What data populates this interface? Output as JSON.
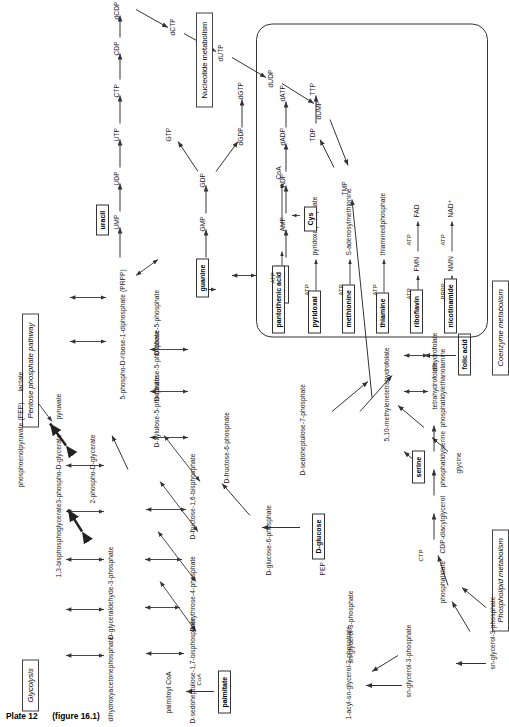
{
  "plate": {
    "caption": "Plate 12",
    "figure_ref": "(figure 16.1)"
  },
  "sections": [
    {
      "id": "glycolysis",
      "label": "Glycolysis",
      "italic": true
    },
    {
      "id": "ppp",
      "label": "Pentose phosphate pathway",
      "italic": true
    },
    {
      "id": "nucleotide",
      "label": "Nucleotide metabolism",
      "italic": false
    },
    {
      "id": "coenzyme",
      "label": "Coenzyme metabolism",
      "italic": true
    },
    {
      "id": "phospholipid",
      "label": "Phospholipid metabolism",
      "italic": true
    }
  ],
  "boxed_nodes": [
    {
      "id": "uracil",
      "label": "uracil"
    },
    {
      "id": "guanine",
      "label": "guanine"
    },
    {
      "id": "adenine",
      "label": "adenine"
    },
    {
      "id": "d-glucose",
      "label": "D-glucose"
    },
    {
      "id": "serine",
      "label": "serine"
    },
    {
      "id": "folic-acid",
      "label": "folic acid"
    },
    {
      "id": "palmitate",
      "label": "palmitate"
    },
    {
      "id": "nicotinamide",
      "label": "nicotinamide"
    },
    {
      "id": "riboflavin",
      "label": "riboflavin"
    },
    {
      "id": "thiamine",
      "label": "thiamine"
    },
    {
      "id": "methionine",
      "label": "methionine"
    },
    {
      "id": "pyridoxal",
      "label": "pyridoxal"
    },
    {
      "id": "pantothenic-acid",
      "label": "pantothenic acid"
    },
    {
      "id": "cys",
      "label": "Cys"
    }
  ],
  "glycolysis": {
    "nodes": [
      "dihydroxyacetonephosphate",
      "D-glyceraldehyde-3-phosphate",
      "1,3-bisphosphoglycerate",
      "3-phospho-D-glycerate",
      "2-phospho-D-glycerate",
      "phosphoenolpyruvate (PEP)",
      "pyruvate",
      "lactate",
      "D-fructose-1,6-bisphosphate",
      "D-fructose-6-phosphate",
      "D-glucose-6-phosphate",
      "D-erythrose-4-phosphate",
      "D-sedoheptulose-1,7-bisphosphate",
      "D-sedoheptulose-7-phosphate",
      "sn-glycerol-3-phosphate"
    ]
  },
  "pentose_phosphate": {
    "nodes": [
      "D-xylulose-5-phosphate",
      "D-ribulose-5-phosphate",
      "D-ribose-5-phosphate",
      "5-phospho-D-ribose-1-diphosphate (PRPP)"
    ]
  },
  "nucleotides": {
    "pyrimidine_chain": [
      "UMP",
      "UDP",
      "UTP",
      "CTP",
      "CDP",
      "dCDP",
      "dCTP",
      "dUTP",
      "dUDP",
      "dUMP"
    ],
    "guanine_chain": [
      "GMP",
      "GDP",
      "GTP",
      "dGDP",
      "dGTP"
    ],
    "adenine_chain": [
      "AMP",
      "ADP",
      "dADP",
      "dATP"
    ],
    "thymidine_chain": [
      "TMP",
      "TDP",
      "TTP"
    ]
  },
  "folate": {
    "nodes": [
      "5,10-methylenetetrahydrofolate",
      "tetrahydrofolate",
      "dihydrofolate",
      "glycine"
    ]
  },
  "phospholipid": {
    "nodes": [
      "palmitoyl CoA",
      "1-acyl-sn-glycerol-3-phosphate",
      "sn-glycerol-3-phosphate",
      "phosphatidate",
      "CDP-diacylglycerol",
      "phosphatidylserine",
      "phosphatidylethanolamine"
    ],
    "cofactors": [
      "CoA",
      "CTP"
    ]
  },
  "coenzyme_metabolism": {
    "rows": [
      {
        "substrate": "nicotinamide",
        "cofactor1": "PRPP",
        "intermediate": "NMN",
        "cofactor2": "ATP",
        "product": "NAD⁺"
      },
      {
        "substrate": "riboflavin",
        "cofactor1": "ATP",
        "intermediate": "FMN",
        "cofactor2": "ATP",
        "product": "FAD"
      },
      {
        "substrate": "thiamine",
        "cofactor1": "ATP",
        "intermediate": "",
        "cofactor2": "",
        "product": "thiaminediphosphate"
      },
      {
        "substrate": "methionine",
        "cofactor1": "ATP",
        "intermediate": "",
        "cofactor2": "",
        "product": "S-adenosylmethionine"
      },
      {
        "substrate": "pyridoxal",
        "cofactor1": "ATP",
        "intermediate": "",
        "cofactor2": "",
        "product": "pyridoxalphosphate"
      },
      {
        "substrate": "pantothenic acid",
        "cofactor1": "ATP",
        "intermediate": "",
        "cofactor2": "ATP",
        "product": "CoA",
        "extra": "Cys"
      }
    ]
  },
  "misc_labels": {
    "pep": "PEP"
  },
  "colors": {
    "ink": "#1a1a1a",
    "line": "#444444",
    "background": "#ffffff"
  }
}
